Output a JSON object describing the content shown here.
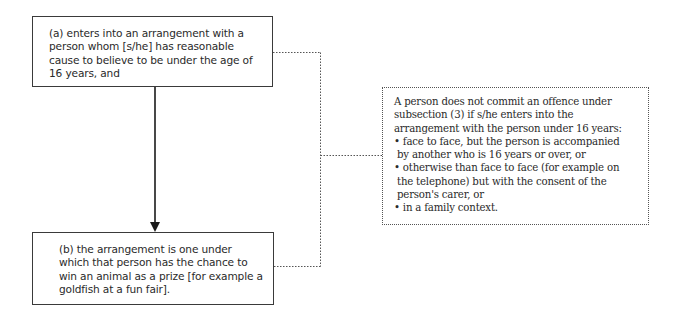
{
  "diagram": {
    "box_a": {
      "text": "(a) enters into an arrangement with a person whom [s/he] has reasonable cause to believe to be under the age of 16 years, and"
    },
    "box_b": {
      "text": "(b) the arrangement is one under which that person has the chance to win an animal as a prize [for example a goldfish at a fun fair]."
    },
    "box_c": {
      "intro": [
        "A person does not commit an offence under",
        "subsection (3) if s/he enters into the",
        "arrangement with the person under 16 years:"
      ],
      "bullets": [
        [
          "• face to face, but the person is accompanied",
          "by another who is 16 years or over, or"
        ],
        [
          "• otherwise than face to face (for example on",
          "the telephone) but with the consent of the",
          "person's carer, or"
        ],
        [
          "• in a family context."
        ]
      ]
    },
    "connectors": {
      "arrow": "box-a to box-b (solid arrow)",
      "dotted": "box-a and box-b to box-c (dotted bracket)"
    }
  }
}
